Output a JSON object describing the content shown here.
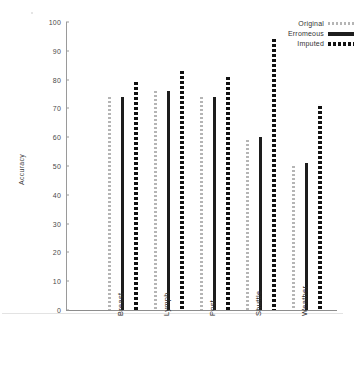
{
  "chart_data": {
    "type": "bar",
    "title": "",
    "xlabel": "",
    "ylabel": "Accuracy",
    "ylim": [
      0,
      100
    ],
    "yticks": [
      0,
      10,
      20,
      30,
      40,
      50,
      60,
      70,
      80,
      90,
      100
    ],
    "grid": false,
    "legend_position": "top-right",
    "categories": [
      "Breast",
      "Lymph",
      "Post",
      "Shuttle",
      "Weather"
    ],
    "series": [
      {
        "name": "Original",
        "style": "dotted-light",
        "color": "#b5b5b5",
        "values": [
          74,
          76,
          74,
          59,
          50
        ]
      },
      {
        "name": "Erromeous",
        "style": "solid",
        "color": "#1d1d1d",
        "values": [
          74,
          76,
          74,
          60,
          51
        ]
      },
      {
        "name": "Imputed",
        "style": "dotted-dark",
        "color": "#111111",
        "values": [
          79,
          83,
          81,
          94,
          71
        ]
      }
    ]
  },
  "axis": {
    "y_title": "Accuracy",
    "y_tick_labels": [
      "100",
      "90",
      "80",
      "70",
      "60",
      "50",
      "40",
      "30",
      "20",
      "10",
      "0"
    ]
  },
  "legend": {
    "entries": [
      {
        "label": "Original",
        "swatch": "dotted-light-line-icon"
      },
      {
        "label": "Erromeous",
        "swatch": "solid-line-icon"
      },
      {
        "label": "Imputed",
        "swatch": "dotted-dark-line-icon"
      }
    ]
  },
  "x_axis": {
    "categories": [
      "Breast",
      "Lymph",
      "Post",
      "Shuttle",
      "Weather"
    ]
  },
  "colors": {
    "original": "#b5b5b5",
    "erroneous": "#1d1d1d",
    "imputed": "#111111",
    "axis": "#9a9a9a",
    "text": "#333333",
    "background": "#ffffff"
  }
}
